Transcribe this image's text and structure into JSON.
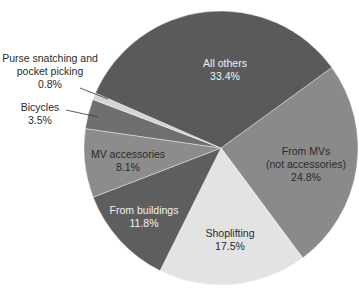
{
  "chart_data": {
    "type": "pie",
    "title": "",
    "start_angle_deg_clockwise_from_top": 54,
    "center": [
      221,
      148
    ],
    "radius": 137,
    "slices": [
      {
        "label": "From MVs (not accessories)",
        "value": 24.8,
        "value_label": "24.8%",
        "color": "#8a8a8a"
      },
      {
        "label": "Shoplifting",
        "value": 17.5,
        "value_label": "17.5%",
        "color": "#e3e3e3"
      },
      {
        "label": "From buildings",
        "value": 11.8,
        "value_label": "11.8%",
        "color": "#5e5e5e"
      },
      {
        "label": "MV accessories",
        "value": 8.1,
        "value_label": "8.1%",
        "color": "#8c8c8c"
      },
      {
        "label": "Bicycles",
        "value": 3.5,
        "value_label": "3.5%",
        "color": "#6f6f6f"
      },
      {
        "label": "Purse snatching and pocket picking",
        "value": 0.8,
        "value_label": "0.8%",
        "color": "#d4d4d4"
      },
      {
        "label": "All others",
        "value": 33.4,
        "value_label": "33.4%",
        "color": "#5a5a5a"
      }
    ]
  },
  "labels": {
    "from_mvs": {
      "line1": "From MVs",
      "line2": "(not accessories)",
      "line3": "24.8%"
    },
    "shoplifting": {
      "line1": "Shoplifting",
      "line2": "17.5%"
    },
    "from_buildings": {
      "line1": "From buildings",
      "line2": "11.8%"
    },
    "mv_accessories": {
      "line1": "MV accessories",
      "line2": "8.1%"
    },
    "bicycles": {
      "line1": "Bicycles",
      "line2": "3.5%"
    },
    "purse": {
      "line1": "Purse snatching and",
      "line2": "pocket picking",
      "line3": "0.8%"
    },
    "all_others": {
      "line1": "All others",
      "line2": "33.4%"
    }
  }
}
